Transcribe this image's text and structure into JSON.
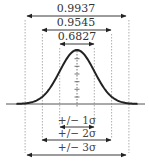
{
  "diagram": {
    "curve": {
      "type": "normal",
      "mean": 0,
      "sd": 1,
      "x_range": [
        -3.5,
        3.5
      ],
      "color": "#222222"
    },
    "axis_color": "#555555",
    "guide_color": "#999999",
    "arrow_color": "#222222",
    "center_ticks": 7,
    "top_intervals": [
      {
        "sigma": 3,
        "label": "0.9937"
      },
      {
        "sigma": 2,
        "label": "0.9545"
      },
      {
        "sigma": 1,
        "label": "0.6827"
      }
    ],
    "bottom_intervals": [
      {
        "sigma": 1,
        "label": "+/− 1σ"
      },
      {
        "sigma": 2,
        "label": "+/− 2σ"
      },
      {
        "sigma": 3,
        "label": "+/− 3σ"
      }
    ]
  }
}
